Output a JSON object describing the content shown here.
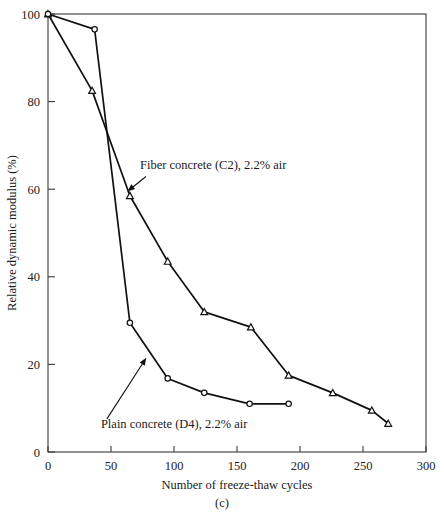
{
  "chart_data": {
    "type": "line",
    "title": "",
    "caption": "(c)",
    "xlabel": "Number of freeze-thaw cycles",
    "ylabel": "Relative dynamic modulus (%)",
    "xlim": [
      0,
      300
    ],
    "ylim": [
      0,
      100
    ],
    "xticks": [
      0,
      50,
      100,
      150,
      200,
      250,
      300
    ],
    "xtick_labels": [
      "0",
      "50",
      "100",
      "150",
      "200",
      "250",
      "300"
    ],
    "yticks": [
      0,
      20,
      40,
      60,
      80,
      100
    ],
    "ytick_labels": [
      "0",
      "20",
      "40",
      "60",
      "80",
      "100"
    ],
    "grid": false,
    "legend_position": "inline-annotations",
    "series": [
      {
        "name": "Fiber concrete (C2), 2.2% air",
        "marker": "triangle-up",
        "color": "#111111",
        "x": [
          0,
          35,
          65,
          95,
          124,
          161,
          191,
          226,
          257,
          270
        ],
        "y": [
          100,
          82.5,
          58.5,
          43.5,
          32.0,
          28.5,
          17.5,
          13.5,
          9.5,
          6.5
        ]
      },
      {
        "name": "Plain concrete (D4), 2.2% air",
        "marker": "circle",
        "color": "#111111",
        "x": [
          0,
          37,
          65,
          95,
          124,
          160,
          191
        ],
        "y": [
          100,
          96.5,
          29.5,
          16.8,
          13.5,
          11.0,
          11.0
        ]
      }
    ],
    "annotations": [
      {
        "text": "Fiber concrete (C2), 2.2% air",
        "text_x": 73,
        "text_y": 64.5,
        "point_x": 63,
        "point_y": 59.5
      },
      {
        "text": "Plain concrete (D4), 2.2% air",
        "text_x": 42,
        "text_y": 5.5,
        "point_x": 78,
        "point_y": 21.5
      }
    ]
  }
}
